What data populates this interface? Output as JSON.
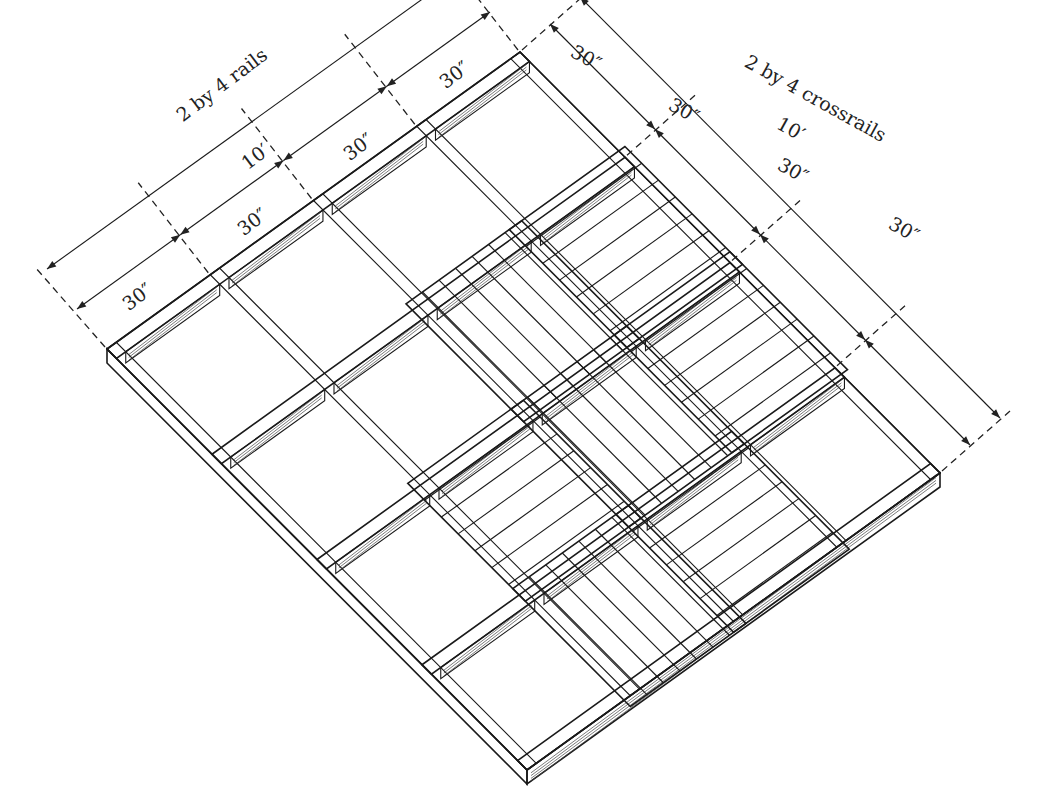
{
  "labels": {
    "rails": "2 by 4 rails",
    "crossrails": "2 by 4 crossrails",
    "rails_total": "10′",
    "crossrails_total": "10′",
    "rail_segments": [
      "30″",
      "30″",
      "30″",
      "30″"
    ],
    "crossrail_segments": [
      "30″",
      "30″",
      "30″",
      "30″"
    ]
  },
  "frame": {
    "grid": "4 x 4 bays",
    "bay_size": "30″ x 30″",
    "overall_size": "10′ x 10′",
    "decked_bays": 7
  },
  "colors": {
    "line": "#1a1a1a",
    "background": "#ffffff"
  }
}
